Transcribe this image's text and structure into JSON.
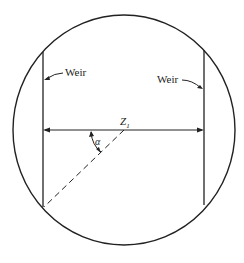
{
  "diagram": {
    "labels": {
      "weir_left": "Weir",
      "weir_right": "Weir",
      "dimension": "Z",
      "dimension_sub": "1",
      "angle": "α"
    }
  }
}
